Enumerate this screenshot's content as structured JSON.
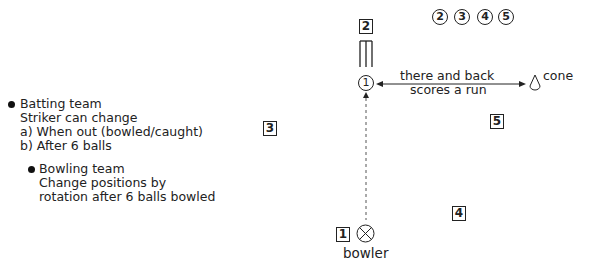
{
  "notes": {
    "batting": {
      "heading": "Batting team",
      "lines": [
        "Striker can change",
        "a) When out (bowled/caught)",
        "b) After 6 balls"
      ]
    },
    "bowling": {
      "heading": "Bowling team",
      "lines": [
        "Change positions by",
        "rotation after 6 balls bowled"
      ]
    }
  },
  "field": {
    "waiting_batters": [
      "2",
      "3",
      "4",
      "5"
    ],
    "striker": "1",
    "fielders": {
      "f1": "1",
      "f2": "2",
      "f3": "3",
      "f4": "4",
      "f5": "5"
    },
    "run_label_line1": "there and back",
    "run_label_line2": "scores a run",
    "cone_label": "cone",
    "bowler_label": "bowler"
  }
}
